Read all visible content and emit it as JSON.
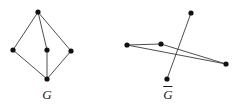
{
  "figure": {
    "background_color": "#ffffff",
    "stroke_color": "#3a3a3a",
    "vertex_color": "#111111",
    "label_color": "#1a1a1a",
    "vertex_radius": 2.6,
    "edge_width": 0.9,
    "graphs": [
      {
        "id": "graph-g",
        "name": "G",
        "label": "G",
        "label_has_overbar": false,
        "label_position": {
          "x": 47,
          "y": 95
        },
        "vertices": [
          {
            "id": "v-top",
            "name": "vertex-top",
            "x": 38,
            "y": 12
          },
          {
            "id": "v-left",
            "name": "vertex-left",
            "x": 13,
            "y": 50
          },
          {
            "id": "v-center",
            "name": "vertex-center",
            "x": 47,
            "y": 50
          },
          {
            "id": "v-right",
            "name": "vertex-right",
            "x": 71,
            "y": 51
          },
          {
            "id": "v-bottom",
            "name": "vertex-bottom",
            "x": 47,
            "y": 79
          }
        ],
        "edges": [
          {
            "from": "v-top",
            "to": "v-left"
          },
          {
            "from": "v-top",
            "to": "v-center"
          },
          {
            "from": "v-top",
            "to": "v-right"
          },
          {
            "from": "v-left",
            "to": "v-bottom"
          },
          {
            "from": "v-center",
            "to": "v-bottom"
          },
          {
            "from": "v-right",
            "to": "v-bottom"
          }
        ]
      },
      {
        "id": "graph-g-complement",
        "name": "G-complement",
        "label": "G",
        "label_has_overbar": true,
        "label_position": {
          "x": 168,
          "y": 96
        },
        "vertices": [
          {
            "id": "w-top",
            "name": "vertex-top",
            "x": 191,
            "y": 13
          },
          {
            "id": "w-left",
            "name": "vertex-left",
            "x": 127,
            "y": 45
          },
          {
            "id": "w-center",
            "name": "vertex-center",
            "x": 161,
            "y": 44
          },
          {
            "id": "w-right",
            "name": "vertex-right",
            "x": 226,
            "y": 64
          },
          {
            "id": "w-bottom",
            "name": "vertex-bottom",
            "x": 167,
            "y": 79
          }
        ],
        "edges": [
          {
            "from": "w-top",
            "to": "w-bottom"
          },
          {
            "from": "w-left",
            "to": "w-center"
          },
          {
            "from": "w-left",
            "to": "w-right"
          },
          {
            "from": "w-center",
            "to": "w-right"
          }
        ]
      }
    ]
  }
}
